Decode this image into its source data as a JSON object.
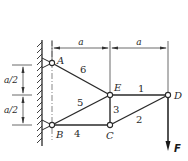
{
  "diagram": {
    "type": "truss",
    "nodes": {
      "A": {
        "label": "A"
      },
      "B": {
        "label": "B"
      },
      "C": {
        "label": "C"
      },
      "D": {
        "label": "D"
      },
      "E": {
        "label": "E"
      }
    },
    "members": [
      {
        "id": "1",
        "label": "1",
        "from": "E",
        "to": "D"
      },
      {
        "id": "2",
        "label": "2",
        "from": "C",
        "to": "D"
      },
      {
        "id": "3",
        "label": "3",
        "from": "C",
        "to": "E"
      },
      {
        "id": "4",
        "label": "4",
        "from": "B",
        "to": "C"
      },
      {
        "id": "5",
        "label": "5",
        "from": "B",
        "to": "E"
      },
      {
        "id": "6",
        "label": "6",
        "from": "A",
        "to": "E"
      }
    ],
    "supports": {
      "wall": "fixed wall with pin supports at A and B"
    },
    "load": {
      "label": "F",
      "at": "D",
      "direction": "down"
    },
    "dimensions": {
      "horizontal": [
        {
          "label": "a"
        },
        {
          "label": "a"
        }
      ],
      "vertical": [
        {
          "label": "a/2"
        },
        {
          "label": "a/2"
        }
      ]
    }
  }
}
